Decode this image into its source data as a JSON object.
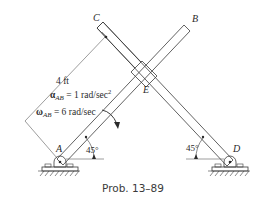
{
  "figure": {
    "caption": "Prob. 13–89",
    "points": {
      "A": "A",
      "B": "B",
      "C": "C",
      "D": "D",
      "E": "E"
    },
    "dimension_length": "4 ft",
    "alpha_symbol": "α",
    "alpha_sub": "AB",
    "alpha_value": " = 1 rad/sec",
    "alpha_exp": "2",
    "omega_symbol": "ω",
    "omega_sub": "AB",
    "omega_value": " = 6 rad/sec",
    "angle_A": "45°",
    "angle_D": "45°"
  }
}
